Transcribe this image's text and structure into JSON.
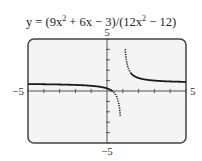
{
  "chart_data": {
    "type": "line",
    "title_parts": {
      "prefix": "y = (9x",
      "exp1": "2",
      "mid": " + 6x − 3)/(12x",
      "exp2": "2",
      "suffix": " − 12)"
    },
    "xlabel": "",
    "ylabel": "",
    "xlim": [
      -5,
      5
    ],
    "ylim": [
      -5,
      5
    ],
    "x_tick_step": 1,
    "y_tick_step": 1,
    "tick_labels": {
      "x_min": "−5",
      "x_max": "5",
      "y_min": "−5",
      "y_max": "5"
    },
    "grid": false,
    "function": "(9*x*x + 6*x - 3)/(12*x*x - 12)",
    "vertical_asymptote": 1,
    "horizontal_asymptote": 0.75,
    "series": [
      {
        "name": "left branch",
        "style": "solid-then-dotted",
        "x": [
          -5,
          -4,
          -3,
          -2,
          -1.5,
          -1,
          -0.5,
          0,
          0.25,
          0.5,
          0.6,
          0.7,
          0.8,
          0.85
        ],
        "y": [
          0.667,
          0.65,
          0.625,
          0.583,
          0.55,
          0.5,
          0.417,
          0.25,
          0.083,
          -0.25,
          -0.5,
          -0.917,
          -1.75,
          -2.583
        ]
      },
      {
        "name": "right branch",
        "style": "dotted-then-solid",
        "x": [
          1.15,
          1.2,
          1.3,
          1.5,
          2,
          3,
          4,
          5
        ],
        "y": [
          4.583,
          3.5,
          2.417,
          1.75,
          1.25,
          1.0,
          0.917,
          0.875
        ]
      }
    ],
    "colors": {
      "curve": "#1a1a1a",
      "frame": "#444444",
      "background": "#f4f4f4"
    }
  }
}
